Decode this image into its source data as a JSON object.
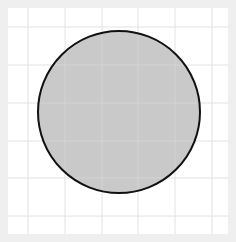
{
  "canvas": {
    "background": "#efefef",
    "panel": {
      "x": 8,
      "y": 8,
      "width": 220,
      "height": 226,
      "fill": "#ffffff"
    },
    "grid": {
      "color": "#e2e2e2",
      "vertical": [
        28,
        65,
        102,
        138,
        175,
        212
      ],
      "horizontal": [
        27,
        65,
        103,
        141,
        178,
        216
      ]
    }
  },
  "shape": {
    "type": "circle",
    "cx": 119,
    "cy": 112,
    "r": 81,
    "fill": "#c4c4c4",
    "stroke": "#111111",
    "stroke_width": 2,
    "fill_opacity": 0.92
  }
}
